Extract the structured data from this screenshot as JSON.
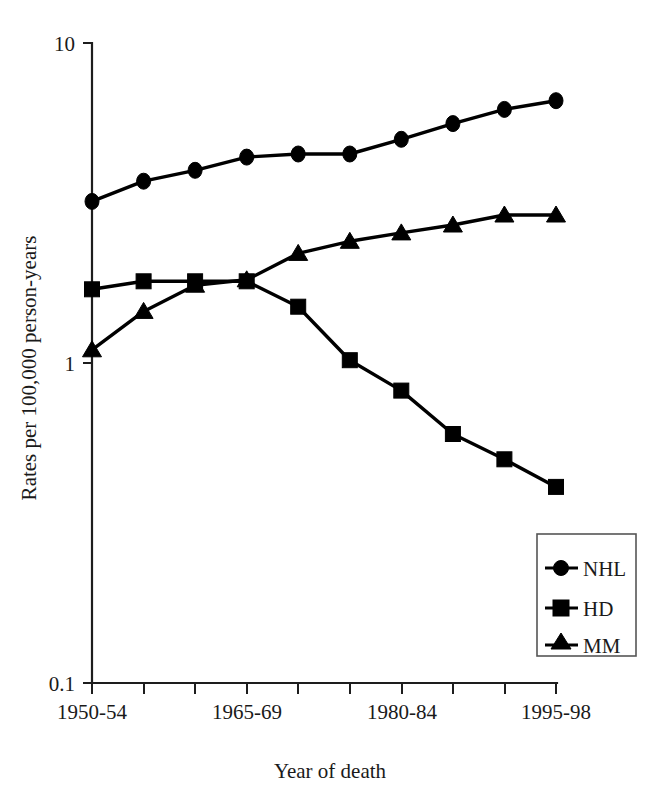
{
  "chart_data": {
    "type": "line",
    "title": "",
    "subtitle": "",
    "xlabel": "Year of death",
    "ylabel": "Rates per 100,000 person-years",
    "yscale": "log",
    "ylim": [
      0.1,
      10
    ],
    "grid": false,
    "legend_position": "bottom-right",
    "categories": [
      "1950-54",
      "1955-59",
      "1960-64",
      "1965-69",
      "1970-74",
      "1975-79",
      "1980-84",
      "1985-89",
      "1990-94",
      "1995-98"
    ],
    "x_tick_labels_shown": [
      "1950-54",
      "1965-69",
      "1980-84",
      "1995-98"
    ],
    "y_tick_labels": [
      "10",
      "1",
      "0.1"
    ],
    "y_tick_values": [
      10,
      1,
      0.1
    ],
    "series": [
      {
        "name": "NHL",
        "marker": "circle",
        "values": [
          3.2,
          3.7,
          4.0,
          4.4,
          4.5,
          4.5,
          5.0,
          5.6,
          6.2,
          6.6
        ]
      },
      {
        "name": "HD",
        "marker": "square",
        "values": [
          1.7,
          1.8,
          1.8,
          1.8,
          1.5,
          1.02,
          0.82,
          0.6,
          0.5,
          0.41
        ]
      },
      {
        "name": "MM",
        "marker": "triangle",
        "values": [
          1.1,
          1.45,
          1.75,
          1.82,
          2.2,
          2.4,
          2.55,
          2.7,
          2.9,
          2.9
        ]
      }
    ]
  },
  "axes": {
    "y_ticks": [
      {
        "label": "10"
      },
      {
        "label": "1"
      },
      {
        "label": "0.1"
      }
    ],
    "x_ticks": [
      {
        "label": "1950-54"
      },
      {
        "label": "1965-69"
      },
      {
        "label": "1980-84"
      },
      {
        "label": "1995-98"
      }
    ],
    "x_title": "Year of death",
    "y_title": "Rates per 100,000 person-years"
  },
  "legend": {
    "items": [
      {
        "label": "NHL",
        "marker": "circle"
      },
      {
        "label": "HD",
        "marker": "square"
      },
      {
        "label": "MM",
        "marker": "triangle"
      }
    ]
  },
  "colors": {
    "ink": "#000000",
    "axis": "#1d1d1d",
    "background": "#ffffff",
    "legend_border": "#555555"
  }
}
